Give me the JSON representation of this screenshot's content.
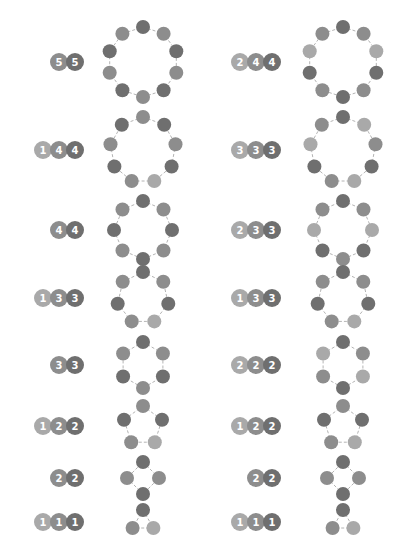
{
  "colors": {
    "light": "#a9a9a9",
    "mid": "#8d8d8d",
    "dark": "#6f6f6f",
    "edge": "#b4b4b4",
    "background": "#ffffff"
  },
  "layout": {
    "badge_right_left_col": 84,
    "badge_right_right_col": 281,
    "ring_cx_left_col": 143,
    "ring_cx_right_col": 343,
    "badge_radius": 9,
    "badge_step": 16,
    "node_radius": 7
  },
  "rows": [
    {
      "y": 62,
      "left": {
        "counts": [
          "5",
          "5"
        ],
        "badge_shades": [
          "mid",
          "dark"
        ],
        "ring_radius": 35,
        "ring": [
          "dark",
          "mid",
          "dark",
          "mid",
          "dark",
          "mid",
          "dark",
          "mid",
          "dark",
          "mid"
        ]
      },
      "right": {
        "counts": [
          "2",
          "4",
          "4"
        ],
        "badge_shades": [
          "light",
          "mid",
          "dark"
        ],
        "ring_radius": 35,
        "ring": [
          "dark",
          "mid",
          "light",
          "dark",
          "mid",
          "dark",
          "mid",
          "dark",
          "light",
          "mid"
        ]
      }
    },
    {
      "y": 150,
      "left": {
        "counts": [
          "1",
          "4",
          "4"
        ],
        "badge_shades": [
          "light",
          "mid",
          "dark"
        ],
        "ring_radius": 33,
        "ring": [
          "mid",
          "dark",
          "mid",
          "dark",
          "light",
          "mid",
          "dark",
          "mid",
          "dark"
        ]
      },
      "right": {
        "counts": [
          "3",
          "3",
          "3"
        ],
        "badge_shades": [
          "light",
          "mid",
          "dark"
        ],
        "ring_radius": 33,
        "ring": [
          "dark",
          "light",
          "mid",
          "dark",
          "light",
          "mid",
          "dark",
          "light",
          "mid"
        ]
      }
    },
    {
      "y": 230,
      "left": {
        "counts": [
          "4",
          "4"
        ],
        "badge_shades": [
          "mid",
          "dark"
        ],
        "ring_radius": 29,
        "ring": [
          "dark",
          "mid",
          "dark",
          "mid",
          "dark",
          "mid",
          "dark",
          "mid"
        ]
      },
      "right": {
        "counts": [
          "2",
          "3",
          "3"
        ],
        "badge_shades": [
          "light",
          "mid",
          "dark"
        ],
        "ring_radius": 29,
        "ring": [
          "dark",
          "mid",
          "light",
          "dark",
          "mid",
          "dark",
          "light",
          "mid"
        ]
      }
    },
    {
      "y": 298,
      "left": {
        "counts": [
          "1",
          "3",
          "3"
        ],
        "badge_shades": [
          "light",
          "mid",
          "dark"
        ],
        "ring_radius": 26,
        "ring": [
          "dark",
          "mid",
          "dark",
          "light",
          "mid",
          "dark",
          "mid"
        ]
      },
      "right": {
        "counts": [
          "1",
          "3",
          "3"
        ],
        "badge_shades": [
          "light",
          "mid",
          "dark"
        ],
        "ring_radius": 26,
        "ring": [
          "dark",
          "mid",
          "dark",
          "light",
          "mid",
          "dark",
          "mid"
        ]
      }
    },
    {
      "y": 365,
      "left": {
        "counts": [
          "3",
          "3"
        ],
        "badge_shades": [
          "mid",
          "dark"
        ],
        "ring_radius": 23,
        "ring": [
          "dark",
          "mid",
          "dark",
          "mid",
          "dark",
          "mid"
        ]
      },
      "right": {
        "counts": [
          "2",
          "2",
          "2"
        ],
        "badge_shades": [
          "light",
          "mid",
          "dark"
        ],
        "ring_radius": 23,
        "ring": [
          "dark",
          "mid",
          "light",
          "dark",
          "mid",
          "light"
        ]
      }
    },
    {
      "y": 426,
      "left": {
        "counts": [
          "1",
          "2",
          "2"
        ],
        "badge_shades": [
          "light",
          "mid",
          "dark"
        ],
        "ring_radius": 20,
        "ring": [
          "mid",
          "dark",
          "light",
          "mid",
          "dark"
        ]
      },
      "right": {
        "counts": [
          "1",
          "2",
          "2"
        ],
        "badge_shades": [
          "light",
          "mid",
          "dark"
        ],
        "ring_radius": 20,
        "ring": [
          "mid",
          "dark",
          "light",
          "mid",
          "dark"
        ]
      }
    },
    {
      "y": 478,
      "left": {
        "counts": [
          "2",
          "2"
        ],
        "badge_shades": [
          "mid",
          "dark"
        ],
        "ring_radius": 16,
        "ring": [
          "dark",
          "mid",
          "dark",
          "mid"
        ]
      },
      "right": {
        "counts": [
          "2",
          "2"
        ],
        "badge_shades": [
          "mid",
          "dark"
        ],
        "ring_radius": 16,
        "ring": [
          "dark",
          "mid",
          "dark",
          "mid"
        ]
      }
    },
    {
      "y": 522,
      "left": {
        "counts": [
          "1",
          "1",
          "1"
        ],
        "badge_shades": [
          "light",
          "mid",
          "dark"
        ],
        "ring_radius": 12,
        "ring": [
          "dark",
          "light",
          "mid"
        ]
      },
      "right": {
        "counts": [
          "1",
          "1",
          "1"
        ],
        "badge_shades": [
          "light",
          "mid",
          "dark"
        ],
        "ring_radius": 12,
        "ring": [
          "dark",
          "light",
          "mid"
        ]
      }
    }
  ]
}
